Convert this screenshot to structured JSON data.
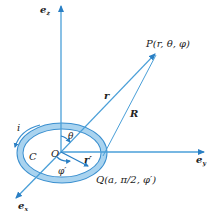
{
  "figure": {
    "axes": {
      "z_label": "e",
      "z_sub": "z",
      "y_label": "e",
      "y_sub": "y",
      "x_label": "e",
      "x_sub": "x"
    },
    "points": {
      "P_label": "P(r, θ, φ)",
      "Q_label": "Q(a, π/2, φ′)",
      "O_label": "O"
    },
    "vectors": {
      "r_label": "r",
      "R_label": "R",
      "r_prime_label": "r′"
    },
    "angles": {
      "theta_label": "θ",
      "phi_prime_label": "φ′"
    },
    "loop": {
      "current_label": "i",
      "contour_label": "C"
    },
    "colors": {
      "axis": "#4a9fd8",
      "ring_fill": "#a9d3ef",
      "ring_stroke": "#3a8fcf",
      "arrow": "#2a7fc4",
      "text": "#222222"
    }
  }
}
